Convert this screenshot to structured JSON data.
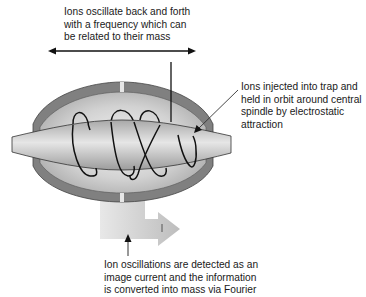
{
  "diagram": {
    "labels": {
      "oscillation": {
        "lines": [
          "Ions oscillate back and forth",
          "with a frequency which can",
          "be related to their mass"
        ]
      },
      "injection": {
        "lines": [
          "Ions injected into trap and",
          "held in orbit around central",
          "spindle by electrostatic",
          "attraction"
        ]
      },
      "detection": {
        "lines": [
          "Ion oscillations are detected as an",
          "image current and the information",
          "is converted into mass via Fourier"
        ]
      }
    },
    "components": [
      "outer-electrode-casing",
      "central-spindle-electrode",
      "ion-trajectory",
      "image-current-output-arrow",
      "axial-double-arrow"
    ],
    "colors": {
      "casing": "#7f7f7f",
      "cavity": "#d9d9d9",
      "spindle": "#c4c4c4",
      "trajectory": "#111111",
      "output_arrow": "#dcdcdc"
    }
  }
}
